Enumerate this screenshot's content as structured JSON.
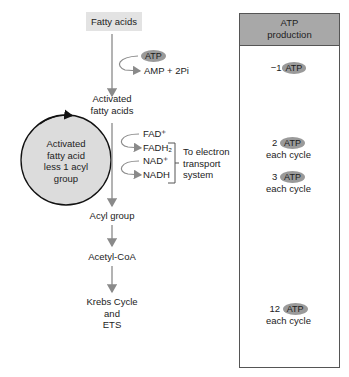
{
  "diagram": {
    "start": "Fatty acids",
    "atp_input": "ATP",
    "atp_output": "AMP + 2Pi",
    "activated": [
      "Activated",
      "fatty acids"
    ],
    "cycle_label": [
      "Activated",
      "fatty acid",
      "less 1 acyl",
      "group"
    ],
    "fad": "FAD⁺",
    "fadh2": "FADH₂",
    "nad": "NAD⁺",
    "nadh": "NADH",
    "ets_note": [
      "To electron",
      "transport",
      "system"
    ],
    "acyl": "Acyl group",
    "acetyl": "Acetyl-CoA",
    "krebs": [
      "Krebs Cycle",
      "and",
      "ETS"
    ]
  },
  "atp_panel": {
    "header": [
      "ATP",
      "production"
    ],
    "atp_label": "ATP",
    "entries": [
      {
        "amount": "−1",
        "note": ""
      },
      {
        "amount": "2",
        "note": "each cycle"
      },
      {
        "amount": "3",
        "note": "each cycle"
      },
      {
        "amount": "12",
        "note": "each cycle"
      }
    ]
  },
  "colors": {
    "arrow": "#8a8a8a",
    "circle_fill": "#dcdcdc",
    "atp_oval": "#9a9a9a",
    "panel_header": "#a8a8a8"
  }
}
